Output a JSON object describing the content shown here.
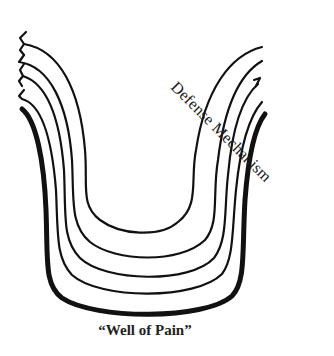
{
  "diagram": {
    "labels": {
      "defense_mechanism": "Defense Mechanism",
      "well_of_pain": "“Well of Pain”"
    },
    "layers": [
      {
        "name": "layer-1-innermost",
        "stroke_width": 2.2,
        "top_edge": "jagged"
      },
      {
        "name": "layer-2",
        "stroke_width": 2.2,
        "top_edge": "jagged"
      },
      {
        "name": "layer-3",
        "stroke_width": 2.2,
        "top_edge": "jagged"
      },
      {
        "name": "layer-4",
        "stroke_width": 2.2,
        "top_edge": "jagged"
      },
      {
        "name": "layer-5-outermost",
        "stroke_width": 5,
        "top_edge": "smooth"
      }
    ],
    "colors": {
      "stroke": "#111111",
      "background": "#ffffff",
      "text": "#1a1a1a"
    }
  }
}
